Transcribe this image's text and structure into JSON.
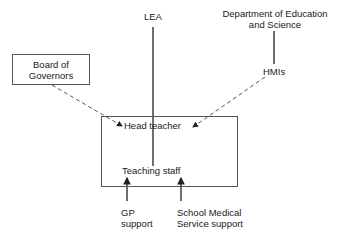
{
  "diagram": {
    "nodes": {
      "lea": "LEA",
      "des_line1": "Department of Education",
      "des_line2": "and Science",
      "hmis": "HMIs",
      "governors_line1": "Board of",
      "governors_line2": "Governors",
      "head_teacher": "Head teacher",
      "teaching_staff": "Teaching staff",
      "gp_line1": "GP",
      "gp_line2": "support",
      "sms_line1": "School Medical",
      "sms_line2": "Service support"
    },
    "edges": [
      {
        "from": "LEA",
        "to": "Teaching staff",
        "style": "solid"
      },
      {
        "from": "Department of Education and Science",
        "to": "HMIs",
        "style": "solid"
      },
      {
        "from": "Board of Governors",
        "to": "Head teacher",
        "style": "dashed-arrow"
      },
      {
        "from": "HMIs",
        "to": "Head teacher",
        "style": "dashed-arrow"
      },
      {
        "from": "GP support",
        "to": "Teaching staff",
        "style": "solid-arrow"
      },
      {
        "from": "School Medical Service support",
        "to": "Teaching staff",
        "style": "solid-arrow"
      }
    ]
  }
}
